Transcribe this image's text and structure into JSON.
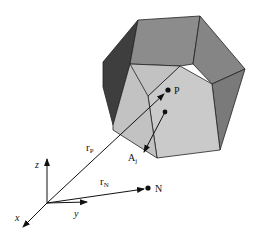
{
  "diagram": {
    "type": "vector-geometry",
    "labels": {
      "point_p": "P",
      "point_n": "N",
      "vector_rp_main": "r",
      "vector_rp_sub": "P",
      "vector_rn_main": "r",
      "vector_rn_sub": "N",
      "area_vector_main": "A",
      "area_vector_sub": "j",
      "axis_x": "x",
      "axis_y": "y",
      "axis_z": "z"
    },
    "colors": {
      "background": "#ffffff",
      "face_light": "#c8c8c8",
      "face_mid": "#8c8c8c",
      "face_right": "#7a7a7a",
      "face_dark": "#3e3e3e",
      "face_darker": "#5a5a5a",
      "edge": "#222222",
      "ink": "#111111"
    }
  },
  "caption": ""
}
